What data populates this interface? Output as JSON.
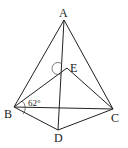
{
  "diagram": {
    "type": "geometry",
    "points": {
      "A": {
        "label": "A",
        "x": 64,
        "y": 20
      },
      "E": {
        "label": "E",
        "x": 67,
        "y": 68
      },
      "B": {
        "label": "B",
        "x": 14,
        "y": 107
      },
      "C": {
        "label": "C",
        "x": 113,
        "y": 109
      },
      "D": {
        "label": "D",
        "x": 58,
        "y": 130
      }
    },
    "segments": [
      "AB",
      "AC",
      "AD",
      "BE",
      "CE",
      "BC",
      "BD",
      "CD"
    ],
    "angle_label": "62°",
    "angle_marks": [
      "angle EBC (62°)",
      "angle AEB"
    ]
  }
}
